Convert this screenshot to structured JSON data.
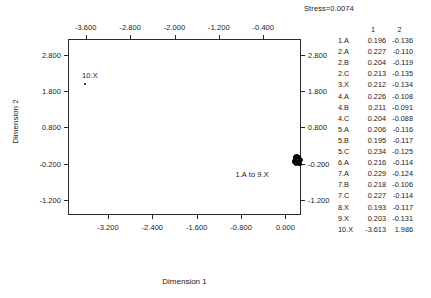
{
  "annotation": {
    "stress": "Stress=0.0074"
  },
  "chart_data": {
    "type": "scatter",
    "title": "",
    "subtitle": "",
    "xlabel": "Dimension 1",
    "ylabel": "Dimension 2",
    "xlim": [
      -3.92,
      0.28
    ],
    "ylim": [
      -1.62,
      3.24
    ],
    "grid": false,
    "legend": null,
    "x_ticks_bottom": [
      "-3.200",
      "-2.400",
      "-1.600",
      "-0.800",
      "0.000"
    ],
    "x_tick_values_bottom": [
      -3.2,
      -2.4,
      -1.6,
      -0.8,
      0.0
    ],
    "x_ticks_top": [
      "-3.600",
      "-2.800",
      "-2.000",
      "-1.200",
      "-0.400"
    ],
    "x_tick_values_top": [
      -3.6,
      -2.8,
      -2.0,
      -1.2,
      -0.4
    ],
    "y_ticks_left": [
      "2.800",
      "1.800",
      "0.800",
      "-0.200",
      "-1.200"
    ],
    "y_tick_values_left": [
      2.8,
      1.8,
      0.8,
      -0.2,
      -1.2
    ],
    "y_ticks_right": [
      "2.800",
      "1.800",
      "0.800",
      "-0.200",
      "-1.200"
    ],
    "y_tick_values_right": [
      2.8,
      1.8,
      0.8,
      -0.2,
      -1.2
    ],
    "annotations": [
      {
        "text": "10.X",
        "x": -3.613,
        "y": 1.986,
        "placement": "above"
      },
      {
        "text": "1.A to 9.X",
        "x": 0.215,
        "y": -0.118,
        "placement": "below-left"
      }
    ],
    "points": [
      {
        "label": "1.A",
        "x": 0.196,
        "y": -0.136
      },
      {
        "label": "2.A",
        "x": 0.227,
        "y": -0.11
      },
      {
        "label": "2.B",
        "x": 0.204,
        "y": -0.119
      },
      {
        "label": "2.C",
        "x": 0.213,
        "y": -0.135
      },
      {
        "label": "3.X",
        "x": 0.212,
        "y": -0.134
      },
      {
        "label": "4.A",
        "x": 0.226,
        "y": -0.108
      },
      {
        "label": "4.B",
        "x": 0.211,
        "y": -0.091
      },
      {
        "label": "4.C",
        "x": 0.204,
        "y": -0.088
      },
      {
        "label": "5.A",
        "x": 0.206,
        "y": -0.116
      },
      {
        "label": "5.B",
        "x": 0.195,
        "y": -0.117
      },
      {
        "label": "5.C",
        "x": 0.234,
        "y": -0.125
      },
      {
        "label": "6.A",
        "x": 0.216,
        "y": -0.114
      },
      {
        "label": "7.A",
        "x": 0.229,
        "y": -0.124
      },
      {
        "label": "7.B",
        "x": 0.218,
        "y": -0.106
      },
      {
        "label": "7.C",
        "x": 0.227,
        "y": -0.114
      },
      {
        "label": "8.X",
        "x": 0.193,
        "y": -0.117
      },
      {
        "label": "9.X",
        "x": 0.203,
        "y": -0.131
      },
      {
        "label": "10.X",
        "x": -3.613,
        "y": 1.986
      }
    ]
  },
  "coord_table": {
    "headers": [
      "",
      "1",
      "2"
    ],
    "rows": [
      {
        "name": "1.A",
        "d1": "0.196",
        "d2": "-0.136"
      },
      {
        "name": "2.A",
        "d1": "0.227",
        "d2": "-0.110"
      },
      {
        "name": "2.B",
        "d1": "0.204",
        "d2": "-0.119"
      },
      {
        "name": "2.C",
        "d1": "0.213",
        "d2": "-0.135"
      },
      {
        "name": "3.X",
        "d1": "0.212",
        "d2": "-0.134"
      },
      {
        "name": "4.A",
        "d1": "0.226",
        "d2": "-0.108"
      },
      {
        "name": "4.B",
        "d1": "0.211",
        "d2": "-0.091"
      },
      {
        "name": "4.C",
        "d1": "0.204",
        "d2": "-0.088"
      },
      {
        "name": "5.A",
        "d1": "0.206",
        "d2": "-0.116"
      },
      {
        "name": "5.B",
        "d1": "0.195",
        "d2": "-0.117"
      },
      {
        "name": "5.C",
        "d1": "0.234",
        "d2": "-0.125"
      },
      {
        "name": "6.A",
        "d1": "0.216",
        "d2": "-0.114"
      },
      {
        "name": "7.A",
        "d1": "0.229",
        "d2": "-0.124"
      },
      {
        "name": "7.B",
        "d1": "0.218",
        "d2": "-0.106"
      },
      {
        "name": "7.C",
        "d1": "0.227",
        "d2": "-0.114"
      },
      {
        "name": "8.X",
        "d1": "0.193",
        "d2": "-0.117"
      },
      {
        "name": "9.X",
        "d1": "0.203",
        "d2": "-0.131"
      },
      {
        "name": "10.X",
        "d1": "-3.613",
        "d2": "1.986"
      }
    ]
  },
  "colors": {
    "axis": "#2b2b2b",
    "text": "#1a1a1a",
    "point": "#000000",
    "background": "#ffffff"
  }
}
